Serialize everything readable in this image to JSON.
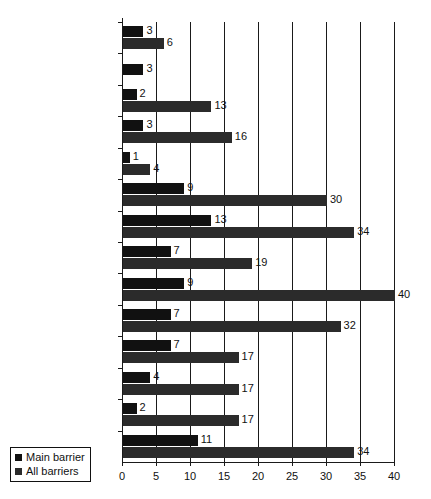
{
  "chart_data": {
    "type": "bar",
    "orientation": "horizontal",
    "title": "",
    "xlabel": "",
    "ylabel": "",
    "xlim": [
      0,
      40
    ],
    "xticks": [
      0,
      5,
      10,
      15,
      20,
      25,
      30,
      35,
      40
    ],
    "grid": true,
    "legend_position": "bottom-left",
    "categories": [
      "Other",
      "Ill health",
      "Lack of self\nconfidence",
      "Wages too low",
      "Sex discrimination",
      "Racial discrimination",
      "Discrimination\nagainst refugees",
      "Little work available",
      "Lack of experience",
      "Lack of information",
      "Child care problems",
      "Relevant vocational\nskills",
      "Literacy",
      "Language"
    ],
    "series": [
      {
        "name": "Main barrier",
        "color": "#111111",
        "values": [
          3,
          3,
          2,
          3,
          1,
          9,
          13,
          7,
          9,
          7,
          7,
          4,
          2,
          11
        ]
      },
      {
        "name": "All barriers",
        "color": "#2b2b2b",
        "values": [
          6,
          null,
          13,
          16,
          4,
          30,
          34,
          19,
          40,
          32,
          17,
          17,
          17,
          34
        ]
      }
    ]
  },
  "legend": {
    "items": [
      {
        "label": "Main barrier",
        "swatch": "main"
      },
      {
        "label": "All barriers",
        "swatch": "all"
      }
    ]
  },
  "footnote": ""
}
